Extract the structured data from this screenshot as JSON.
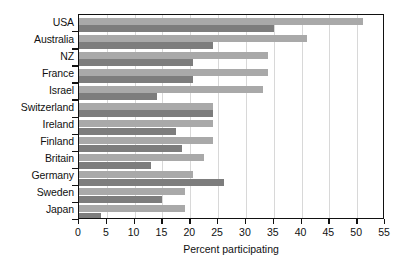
{
  "chart_data": {
    "type": "bar",
    "orientation": "horizontal",
    "title": "",
    "xlabel": "Percent participating",
    "ylabel": "",
    "xlim": [
      0,
      55
    ],
    "xticks": [
      0,
      5,
      10,
      15,
      20,
      25,
      30,
      35,
      40,
      45,
      50,
      55
    ],
    "grid": true,
    "grid_axis": "x",
    "legend": "none",
    "categories": [
      "USA",
      "Australia",
      "NZ",
      "France",
      "Israel",
      "Switzerland",
      "Ireland",
      "Finland",
      "Britain",
      "Germany",
      "Sweden",
      "Japan"
    ],
    "series": [
      {
        "name": "light",
        "color": "#a9a9a9",
        "values": [
          51,
          41,
          34,
          34,
          33,
          24,
          24,
          24,
          22.5,
          20.5,
          19,
          19
        ]
      },
      {
        "name": "dark",
        "color": "#7d7d7d",
        "values": [
          35,
          24,
          20.5,
          20.5,
          14,
          24,
          17.5,
          18.5,
          13,
          26,
          15,
          4
        ]
      }
    ]
  },
  "axis": {
    "x_title": "Percent participating"
  }
}
